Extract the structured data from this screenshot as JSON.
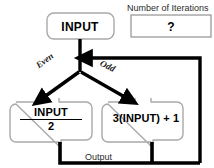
{
  "diagram": {
    "title_hidden": "",
    "nodes": {
      "input": {
        "label": "INPUT"
      },
      "even_branch": {
        "numerator": "INPUT",
        "denominator": "2"
      },
      "odd_branch": {
        "label": "3(INPUT) + 1"
      }
    },
    "edge_labels": {
      "even": "Even",
      "odd": "Odd",
      "output": "Output"
    },
    "panel": {
      "caption": "Number of Iterations",
      "value": "?"
    },
    "colors": {
      "background": "#ffffff",
      "line": "#000000",
      "box_border": "#a8a8a8",
      "text": "#000000",
      "muted_text": "#2b2b2b"
    }
  }
}
